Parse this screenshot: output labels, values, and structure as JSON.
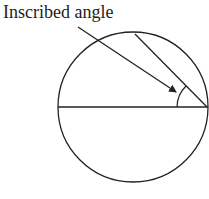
{
  "diagram": {
    "label": "Inscribed angle",
    "stroke_color": "#222222",
    "circle": {
      "cx": 133,
      "cy": 107,
      "r": 75
    },
    "diameter": {
      "x1": 58,
      "y1": 107,
      "x2": 208,
      "y2": 107
    },
    "chord": {
      "x1": 135,
      "y1": 34,
      "x2": 207,
      "y2": 107
    },
    "arrow": {
      "x1": 78,
      "y1": 27,
      "x2": 176,
      "y2": 92
    }
  }
}
